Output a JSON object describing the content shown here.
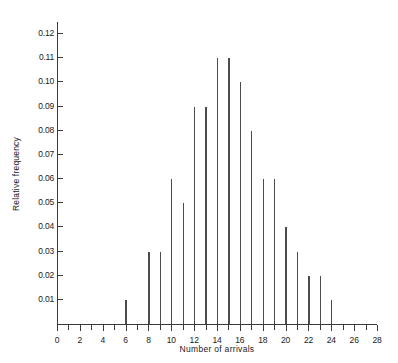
{
  "chart_data": {
    "type": "bar",
    "title": "",
    "xlabel": "Number of arrivals",
    "ylabel": "Relative frequency",
    "xlim": [
      0,
      28
    ],
    "ylim": [
      0,
      0.125
    ],
    "grid": false,
    "legend": null,
    "x_tick_labels": [
      "0",
      "2",
      "4",
      "6",
      "8",
      "10",
      "12",
      "14",
      "16",
      "18",
      "20",
      "22",
      "24",
      "26",
      "28"
    ],
    "x_tick_values": [
      0,
      2,
      4,
      6,
      8,
      10,
      12,
      14,
      16,
      18,
      20,
      22,
      24,
      26,
      28
    ],
    "x_minor_ticks": [
      1,
      3,
      5,
      7,
      9,
      11,
      13,
      15,
      17,
      19,
      21,
      23,
      25,
      27
    ],
    "y_tick_labels": [
      "0.01",
      "0.02",
      "0.03",
      "0.04",
      "0.05",
      "0.06",
      "0.07",
      "0.08",
      "0.09",
      "0.10",
      "0.11",
      "0.12"
    ],
    "y_tick_values": [
      0.01,
      0.02,
      0.03,
      0.04,
      0.05,
      0.06,
      0.07,
      0.08,
      0.09,
      0.1,
      0.11,
      0.12
    ],
    "categories": [
      6,
      8,
      9,
      10,
      11,
      12,
      13,
      14,
      15,
      16,
      17,
      18,
      19,
      20,
      21,
      22,
      23,
      24
    ],
    "values": [
      0.01,
      0.03,
      0.03,
      0.06,
      0.05,
      0.09,
      0.09,
      0.11,
      0.11,
      0.1,
      0.08,
      0.06,
      0.06,
      0.04,
      0.03,
      0.02,
      0.02,
      0.01
    ],
    "bar_color": "#4c4c4c",
    "axis_color": "#3a3a3a"
  }
}
